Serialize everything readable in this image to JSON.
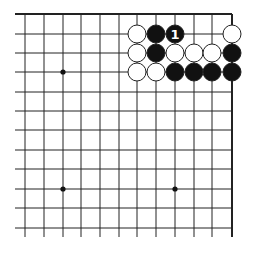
{
  "diagram": {
    "type": "go-board-corner",
    "grid": {
      "columns_x": [
        25,
        44,
        63,
        81,
        100,
        119,
        137,
        156,
        175,
        194,
        212,
        232
      ],
      "rows_y": [
        14,
        34,
        53,
        72,
        92,
        111,
        130,
        150,
        169,
        189,
        208,
        228
      ],
      "top_edge_row": 0,
      "right_edge_col": 11,
      "line_extend_bottom": 237,
      "line_extend_left": 15,
      "line_color": "#222222",
      "edge_width": 2
    },
    "hoshi": [
      {
        "col": 2,
        "row": 3
      },
      {
        "col": 2,
        "row": 9
      },
      {
        "col": 8,
        "row": 9
      }
    ],
    "stones": [
      {
        "col": 6,
        "row": 1,
        "color": "white"
      },
      {
        "col": 7,
        "row": 1,
        "color": "black"
      },
      {
        "col": 8,
        "row": 1,
        "color": "black",
        "label": "1"
      },
      {
        "col": 11,
        "row": 1,
        "color": "white"
      },
      {
        "col": 6,
        "row": 2,
        "color": "white"
      },
      {
        "col": 7,
        "row": 2,
        "color": "black"
      },
      {
        "col": 8,
        "row": 2,
        "color": "white"
      },
      {
        "col": 9,
        "row": 2,
        "color": "white"
      },
      {
        "col": 10,
        "row": 2,
        "color": "white"
      },
      {
        "col": 11,
        "row": 2,
        "color": "black"
      },
      {
        "col": 6,
        "row": 3,
        "color": "white"
      },
      {
        "col": 7,
        "row": 3,
        "color": "white"
      },
      {
        "col": 8,
        "row": 3,
        "color": "black"
      },
      {
        "col": 9,
        "row": 3,
        "color": "black"
      },
      {
        "col": 10,
        "row": 3,
        "color": "black"
      },
      {
        "col": 11,
        "row": 3,
        "color": "black"
      }
    ],
    "stone_radius": 9,
    "colors": {
      "black": "#111111",
      "white": "#ffffff",
      "outline": "#222222",
      "label_on_black": "#ffffff"
    }
  }
}
